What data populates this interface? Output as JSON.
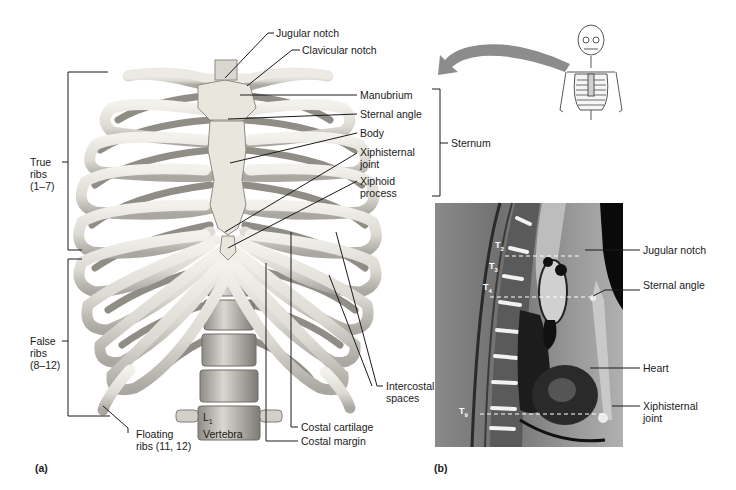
{
  "panel_a": {
    "tag": "(a)",
    "labels": {
      "jugular_notch": "Jugular notch",
      "clavicular_notch": "Clavicular notch",
      "manubrium": "Manubrium",
      "sternal_angle": "Sternal angle",
      "body": "Body",
      "xiphisternal_joint_1": "Xiphisternal",
      "xiphisternal_joint_2": "joint",
      "xiphoid_process_1": "Xiphoid",
      "xiphoid_process_2": "process",
      "sternum": "Sternum",
      "true_ribs_1": "True",
      "true_ribs_2": "ribs",
      "true_ribs_3": "(1–7)",
      "false_ribs_1": "False",
      "false_ribs_2": "ribs",
      "false_ribs_3": "(8–12)",
      "floating_ribs_1": "Floating",
      "floating_ribs_2": "ribs (11, 12)",
      "l1": "L",
      "l1_sub": "1",
      "vertebra": "Vertebra",
      "intercostal_spaces_1": "Intercostal",
      "intercostal_spaces_2": "spaces",
      "costal_cartilage": "Costal cartilage",
      "costal_margin": "Costal margin"
    }
  },
  "panel_b": {
    "tag": "(b)",
    "vertebra_labels": {
      "t2": "T",
      "t2_sub": "2",
      "t3": "T",
      "t3_sub": "3",
      "t4": "T",
      "t4_sub": "4",
      "t9": "T",
      "t9_sub": "9"
    },
    "labels": {
      "jugular_notch": "Jugular notch",
      "sternal_angle": "Sternal angle",
      "heart": "Heart",
      "xiphisternal_joint_1": "Xiphisternal",
      "xiphisternal_joint_2": "joint"
    }
  },
  "colors": {
    "bone": "#e6e4dc",
    "bone_shadow": "#9a9890",
    "cartilage": "#d8d6cc",
    "arrow": "#8c8c8c",
    "mri_bg": "#6e6e6e",
    "leader": "#1a1a1a"
  }
}
